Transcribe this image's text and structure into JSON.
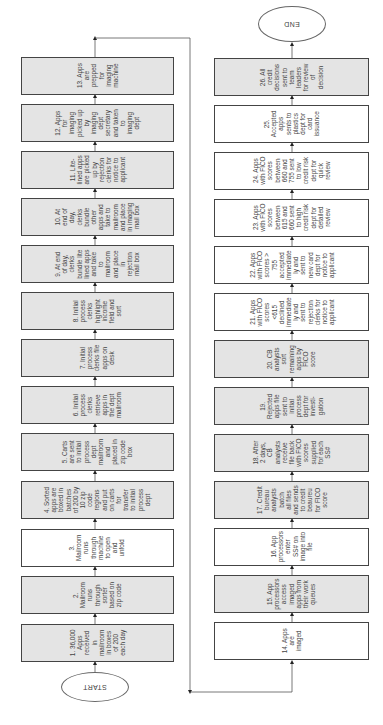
{
  "diagram": {
    "type": "flowchart",
    "orientation": "rotated",
    "start_label": "START",
    "end_label": "END",
    "colors": {
      "gray_fill": "#e4e4e4",
      "white_fill": "#ffffff",
      "border": "#444444",
      "text": "#444444"
    },
    "left_column": [
      {
        "id": 13,
        "fill": "gray",
        "lines": [
          "13. Apps",
          "are",
          "prepped",
          "for",
          "imaging",
          "machine"
        ]
      },
      {
        "id": 12,
        "fill": "gray",
        "lines": [
          "12. Apps",
          "for",
          "imaging",
          "picked up",
          "by",
          "imaging",
          "dept",
          "secretary",
          "and taken",
          "to",
          "imaging",
          "dept"
        ]
      },
      {
        "id": 11,
        "fill": "gray",
        "lines": [
          "11. Lite-",
          "lined apps",
          "are picked",
          "up by",
          "rejection",
          "clerks for",
          "notice to",
          "applicant"
        ]
      },
      {
        "id": 10,
        "fill": "gray",
        "lines": [
          "10. At",
          "end of",
          "day,",
          "clerks",
          "bundle",
          "other",
          "apps and",
          "take to",
          "mailroom",
          "and place",
          "in imaging",
          "mail box"
        ]
      },
      {
        "id": 9,
        "fill": "gray",
        "lines": [
          "9. At end",
          "of day,",
          "clerks",
          "bundle lite",
          "lined apps",
          "and take",
          "to",
          "mailroom",
          "and place",
          "in",
          "rejection",
          "mail box"
        ]
      },
      {
        "id": 8,
        "fill": "gray",
        "lines": [
          "8. Initial",
          "process",
          "clerks",
          "highlight",
          "income",
          "field and",
          "sort"
        ]
      },
      {
        "id": 7,
        "fill": "gray",
        "lines": [
          "7. Initial",
          "process",
          "clerks file",
          "apps on",
          "desk"
        ]
      },
      {
        "id": 6,
        "fill": "gray",
        "lines": [
          "6. Initial",
          "process",
          "clerks",
          "retrieve",
          "apps in",
          "the dept",
          "mailroom"
        ]
      },
      {
        "id": 5,
        "fill": "gray",
        "lines": [
          "5. Carts",
          "are sent",
          "to initial",
          "process",
          "dept",
          "mailroom",
          "and",
          "placed in",
          "zip code",
          "box"
        ]
      },
      {
        "id": 4,
        "fill": "gray",
        "lines": [
          "4. Sorted",
          "apps are",
          "boxed in",
          "batches",
          "of 200 by",
          "10 zip",
          "code",
          "regions",
          "and put",
          "on carts",
          "for",
          "transfer",
          "to initial",
          "process",
          "dept"
        ]
      },
      {
        "id": 3,
        "fill": "white",
        "lines": [
          "3.",
          "Mailroom",
          "runs",
          "through",
          "machine",
          "to open",
          "and",
          "unfold"
        ]
      },
      {
        "id": 2,
        "fill": "gray",
        "lines": [
          "2.",
          "Mailroom",
          "runs",
          "through",
          "sorter",
          "based on",
          "zip code"
        ]
      },
      {
        "id": 1,
        "fill": "gray",
        "lines": [
          "1. 36,000",
          "Apps",
          "received",
          "in",
          "mailroom",
          "in boxes",
          "of 200",
          "each day"
        ]
      }
    ],
    "right_column": [
      {
        "id": 26,
        "fill": "gray",
        "lines": [
          "26. All",
          "credit",
          "decisions",
          "sent to",
          "team",
          "leaders",
          "for review",
          "of",
          "decision"
        ]
      },
      {
        "id": 25,
        "fill": "white",
        "lines": [
          "25.",
          "Accepted",
          "apps",
          "sents to",
          "plastics",
          "dept for",
          "card",
          "issuance"
        ]
      },
      {
        "id": 24,
        "fill": "white",
        "lines": [
          "24. Apps",
          "with FICO",
          "scores",
          "between",
          "660 and",
          "755 sent",
          "to low",
          "credit risk",
          "dept for",
          "quick",
          "review"
        ]
      },
      {
        "id": 23,
        "fill": "white",
        "lines": [
          "23. Apps",
          "with FICO",
          "scores",
          "between",
          "615 and",
          "660 sent",
          "to high",
          "credit risk",
          "dept for",
          "detailed",
          "review"
        ]
      },
      {
        "id": 22,
        "fill": "white",
        "lines": [
          "22. Apps",
          "with FICO",
          "scores >",
          "755",
          "accepted",
          "immediate",
          "ly and",
          "sent to",
          "new card",
          "dept for",
          "notice to",
          "applicant"
        ]
      },
      {
        "id": 21,
        "fill": "white",
        "lines": [
          "21. Apps",
          "with FICO",
          "scores",
          "<615",
          "declined",
          "immediate",
          "ly and",
          "sent to",
          "rejection",
          "clerks for",
          "notice to",
          "applicant"
        ]
      },
      {
        "id": 20,
        "fill": "gray",
        "lines": [
          "20. CB",
          "analysts",
          "sort",
          "remaining",
          "apps by",
          "FICO",
          "score"
        ]
      },
      {
        "id": 19,
        "fill": "gray",
        "lines": [
          "19.",
          "Rejected",
          "apps file",
          "sent to",
          "initial",
          "process",
          "dept for",
          "investi-",
          "gation"
        ]
      },
      {
        "id": 18,
        "fill": "gray",
        "lines": [
          "18. After",
          "2 days,",
          "CB",
          "analysts",
          "receive",
          "file back",
          "with FICO",
          "scores",
          "supplied",
          "for each",
          "SS#"
        ]
      },
      {
        "id": 17,
        "fill": "gray",
        "lines": [
          "17. Credit",
          "bureau",
          "analysts",
          "batch",
          "all files",
          "and sends",
          "to credit",
          "beaureu",
          "for FICO",
          "score"
        ]
      },
      {
        "id": 16,
        "fill": "white",
        "lines": [
          "16. App",
          "processors",
          "enter",
          "SS# on",
          "image into",
          "file"
        ]
      },
      {
        "id": 15,
        "fill": "gray",
        "lines": [
          "15. App",
          "processors",
          "access",
          "imaged",
          "apps from",
          "their work",
          "queues"
        ]
      },
      {
        "id": 14,
        "fill": "white",
        "lines": [
          "14. Apps",
          "are",
          "imaged"
        ]
      }
    ]
  }
}
